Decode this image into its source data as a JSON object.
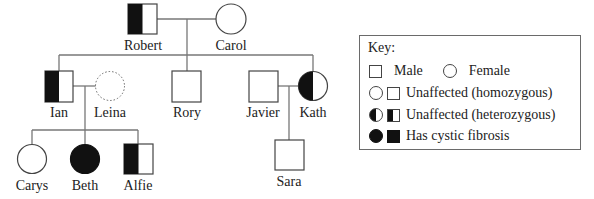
{
  "pedigree": {
    "individuals": [
      {
        "name": "Robert",
        "sex": "male",
        "status": "heterozygous"
      },
      {
        "name": "Carol",
        "sex": "female",
        "status": "homozygous-unaffected"
      },
      {
        "name": "Ian",
        "sex": "male",
        "status": "heterozygous"
      },
      {
        "name": "Leina",
        "sex": "female",
        "status": "unknown-dotted"
      },
      {
        "name": "Rory",
        "sex": "male",
        "status": "homozygous-unaffected"
      },
      {
        "name": "Javier",
        "sex": "male",
        "status": "homozygous-unaffected"
      },
      {
        "name": "Kath",
        "sex": "female",
        "status": "heterozygous"
      },
      {
        "name": "Carys",
        "sex": "female",
        "status": "homozygous-unaffected"
      },
      {
        "name": "Beth",
        "sex": "female",
        "status": "affected"
      },
      {
        "name": "Alfie",
        "sex": "male",
        "status": "heterozygous"
      },
      {
        "name": "Sara",
        "sex": "male",
        "status": "homozygous-unaffected"
      }
    ]
  },
  "labels": {
    "robert": "Robert",
    "carol": "Carol",
    "ian": "Ian",
    "leina": "Leina",
    "rory": "Rory",
    "javier": "Javier",
    "kath": "Kath",
    "carys": "Carys",
    "beth": "Beth",
    "alfie": "Alfie",
    "sara": "Sara"
  },
  "key": {
    "title": "Key:",
    "male": "Male",
    "female": "Female",
    "homozygous": "Unaffected (homozygous)",
    "heterozygous": "Unaffected (heterozygous)",
    "affected": "Has cystic fibrosis"
  },
  "colors": {
    "fill": "#111111",
    "line": "#444444",
    "connector": "#777777"
  }
}
